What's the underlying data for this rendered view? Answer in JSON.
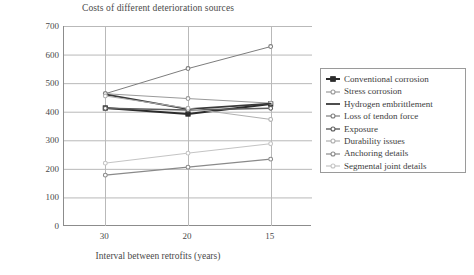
{
  "chart_data": {
    "type": "line",
    "title": "Costs of different deterioration sources",
    "xlabel": "Interval between retrofits (years)",
    "ylabel": "Cost",
    "categories": [
      "30",
      "20",
      "15"
    ],
    "ylim": [
      0,
      700
    ],
    "ytick_labels": [
      "0",
      "100",
      "200",
      "300",
      "400",
      "500",
      "600",
      "700"
    ],
    "ytick_values": [
      0,
      100,
      200,
      300,
      400,
      500,
      600,
      700
    ],
    "grid": true,
    "legend_position": "right",
    "series": [
      {
        "name": "Conventional corrosion",
        "values": [
          413,
          392,
          427
        ],
        "color": "#2b2b2b",
        "width": 2.0,
        "marker": "square"
      },
      {
        "name": "Stress corrosion",
        "values": [
          463,
          446,
          430
        ],
        "color": "#9a9a9a",
        "width": 1.0,
        "marker": "circle"
      },
      {
        "name": "Hydrogen embrittlement",
        "values": [
          461,
          409,
          428
        ],
        "color": "#3a3a3a",
        "width": 1.8,
        "marker": "none"
      },
      {
        "name": "Loss of tendon force",
        "values": [
          463,
          551,
          628
        ],
        "color": "#7d7d7d",
        "width": 1.0,
        "marker": "circle"
      },
      {
        "name": "Exposure",
        "values": [
          412,
          406,
          412
        ],
        "color": "#5e5e5e",
        "width": 1.4,
        "marker": "circle"
      },
      {
        "name": "Durability issues",
        "values": [
          455,
          412,
          373
        ],
        "color": "#b0b0b0",
        "width": 1.0,
        "marker": "circle"
      },
      {
        "name": "Anchoring details",
        "values": [
          178,
          206,
          234
        ],
        "color": "#8a8a8a",
        "width": 1.2,
        "marker": "circle"
      },
      {
        "name": "Segmental joint details",
        "values": [
          220,
          255,
          288
        ],
        "color": "#c4c4c4",
        "width": 1.0,
        "marker": "circle"
      }
    ]
  },
  "colors": {
    "axis": "#8c8c8c",
    "grid": "#b9b9b9",
    "text": "#4a4a4a",
    "legend_border": "#9a9a9a",
    "background": "#ffffff"
  }
}
